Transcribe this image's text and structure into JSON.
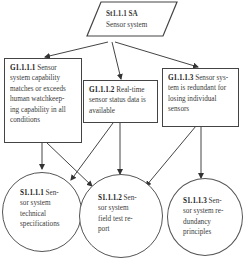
{
  "diagram": {
    "type": "goal-structuring-notation",
    "strategy": {
      "id": "St1.1.1 SA",
      "label": "Sensor system"
    },
    "goals": [
      {
        "id": "G1.1.1.1",
        "text": "Sensor system capability matches or exceeds human watchkeeping capability in all conditions",
        "lines": [
          "G1.1.1.1",
          " Sensor",
          "system capability",
          "matches or exceeds",
          "human watchkeep-",
          "ing capability in all",
          "conditions"
        ]
      },
      {
        "id": "G1.1.1.2",
        "text": "Real-time sensor status data is available",
        "lines": [
          "G1.1.1.2",
          " Real-time",
          "sensor status data is",
          "available"
        ]
      },
      {
        "id": "G1.1.1.3",
        "text": "Sensor system is redundant for losing individual sensors",
        "lines": [
          "G1.1.1.3",
          " Sensor sys-",
          "tem is redundant for",
          "losing individual",
          "sensors"
        ]
      }
    ],
    "solutions": [
      {
        "id": "S1.1.1.1",
        "text": "Sensor system technical specifications",
        "lines": [
          "S1.1.1.1",
          " Sen-",
          "sor system",
          "technical",
          "specifications"
        ]
      },
      {
        "id": "S1.1.1.2",
        "text": "Sensor system field test report",
        "lines": [
          "S1.1.1.2",
          " Sen-",
          "sor system",
          "field test re-",
          "port"
        ]
      },
      {
        "id": "S1.1.1.3",
        "text": "Sensor system redundancy principles",
        "lines": [
          "S1.1.1.3",
          " Sen-",
          "sor system re-",
          "dundancy",
          "principles"
        ]
      }
    ],
    "edges": [
      [
        "St1.1.1 SA",
        "G1.1.1.1"
      ],
      [
        "St1.1.1 SA",
        "G1.1.1.2"
      ],
      [
        "St1.1.1 SA",
        "G1.1.1.3"
      ],
      [
        "G1.1.1.1",
        "S1.1.1.1"
      ],
      [
        "G1.1.1.1",
        "S1.1.1.2"
      ],
      [
        "G1.1.1.2",
        "S1.1.1.1"
      ],
      [
        "G1.1.1.2",
        "S1.1.1.2"
      ],
      [
        "G1.1.1.3",
        "S1.1.1.2"
      ],
      [
        "G1.1.1.3",
        "S1.1.1.3"
      ]
    ]
  }
}
